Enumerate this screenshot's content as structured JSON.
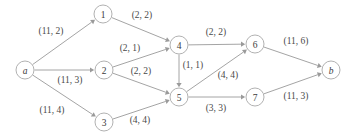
{
  "figure": {
    "background_color": "#ffffff",
    "node_color": "#ffffff",
    "node_stroke_color": "#a8a8a8",
    "edge_color": "#9a9a9a",
    "label_color": "#4a4a4a"
  },
  "nodes": [
    {
      "id": "a",
      "label": "a",
      "x": 25,
      "y": 70,
      "r": 9,
      "italic": true
    },
    {
      "id": "1",
      "label": "1",
      "x": 103,
      "y": 14,
      "r": 9,
      "italic": false
    },
    {
      "id": "2",
      "label": "2",
      "x": 104,
      "y": 70,
      "r": 9,
      "italic": false
    },
    {
      "id": "3",
      "label": "3",
      "x": 104,
      "y": 122,
      "r": 9,
      "italic": false
    },
    {
      "id": "4",
      "label": "4",
      "x": 179,
      "y": 45,
      "r": 9,
      "italic": false
    },
    {
      "id": "5",
      "label": "5",
      "x": 179,
      "y": 97,
      "r": 9,
      "italic": false
    },
    {
      "id": "6",
      "label": "6",
      "x": 255,
      "y": 44,
      "r": 9,
      "italic": false
    },
    {
      "id": "7",
      "label": "7",
      "x": 255,
      "y": 97,
      "r": 9,
      "italic": false
    },
    {
      "id": "b",
      "label": "b",
      "x": 331,
      "y": 70,
      "r": 9,
      "italic": true
    }
  ],
  "edges": [
    {
      "from": "a",
      "to": "1",
      "label": "(11, 2)",
      "capacity": 11,
      "flow": 2,
      "label_x": 51,
      "label_y": 31
    },
    {
      "from": "a",
      "to": "2",
      "label": "(11, 3)",
      "capacity": 11,
      "flow": 3,
      "label_x": 70,
      "label_y": 80
    },
    {
      "from": "a",
      "to": "3",
      "label": "(11, 4)",
      "capacity": 11,
      "flow": 4,
      "label_x": 52,
      "label_y": 110
    },
    {
      "from": "1",
      "to": "4",
      "label": "(2, 2)",
      "capacity": 2,
      "flow": 2,
      "label_x": 142,
      "label_y": 15
    },
    {
      "from": "2",
      "to": "4",
      "label": "(2, 1)",
      "capacity": 2,
      "flow": 1,
      "label_x": 130,
      "label_y": 48
    },
    {
      "from": "2",
      "to": "5",
      "label": "(2, 2)",
      "capacity": 2,
      "flow": 2,
      "label_x": 141,
      "label_y": 71
    },
    {
      "from": "3",
      "to": "5",
      "label": "(4, 4)",
      "capacity": 4,
      "flow": 4,
      "label_x": 140,
      "label_y": 120
    },
    {
      "from": "4",
      "to": "5",
      "label": "(1, 1)",
      "capacity": 1,
      "flow": 1,
      "label_x": 193,
      "label_y": 65
    },
    {
      "from": "4",
      "to": "6",
      "label": "(2, 2)",
      "capacity": 2,
      "flow": 2,
      "label_x": 216,
      "label_y": 32
    },
    {
      "from": "5",
      "to": "6",
      "label": "(4, 4)",
      "capacity": 4,
      "flow": 4,
      "label_x": 228,
      "label_y": 75
    },
    {
      "from": "5",
      "to": "7",
      "label": "(3, 3)",
      "capacity": 3,
      "flow": 3,
      "label_x": 216,
      "label_y": 108
    },
    {
      "from": "6",
      "to": "b",
      "label": "(11, 6)",
      "capacity": 11,
      "flow": 6,
      "label_x": 296,
      "label_y": 41
    },
    {
      "from": "7",
      "to": "b",
      "label": "(11, 3)",
      "capacity": 11,
      "flow": 3,
      "label_x": 296,
      "label_y": 96
    }
  ]
}
